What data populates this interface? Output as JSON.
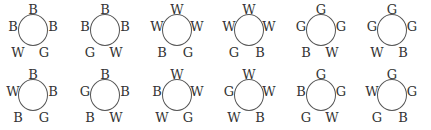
{
  "diagrams": [
    {
      "top": "B",
      "left": "B",
      "right": "B",
      "bottom_left": "W",
      "bottom_right": "G"
    },
    {
      "top": "B",
      "left": "B",
      "right": "B",
      "bottom_left": "G",
      "bottom_right": "W"
    },
    {
      "top": "W",
      "left": "W",
      "right": "W",
      "bottom_left": "B",
      "bottom_right": "G"
    },
    {
      "top": "W",
      "left": "W",
      "right": "W",
      "bottom_left": "G",
      "bottom_right": "B"
    },
    {
      "top": "G",
      "left": "G",
      "right": "G",
      "bottom_left": "B",
      "bottom_right": "W"
    },
    {
      "top": "G",
      "left": "G",
      "right": "G",
      "bottom_left": "W",
      "bottom_right": "B"
    },
    {
      "top": "B",
      "left": "W",
      "right": "B",
      "bottom_left": "B",
      "bottom_right": "G"
    },
    {
      "top": "B",
      "left": "G",
      "right": "B",
      "bottom_left": "B",
      "bottom_right": "W"
    },
    {
      "top": "W",
      "left": "B",
      "right": "W",
      "bottom_left": "W",
      "bottom_right": "G"
    },
    {
      "top": "W",
      "left": "G",
      "right": "W",
      "bottom_left": "W",
      "bottom_right": "B"
    },
    {
      "top": "G",
      "left": "B",
      "right": "G",
      "bottom_left": "G",
      "bottom_right": "W"
    },
    {
      "top": "G",
      "left": "W",
      "right": "G",
      "bottom_left": "G",
      "bottom_right": "B"
    }
  ]
}
